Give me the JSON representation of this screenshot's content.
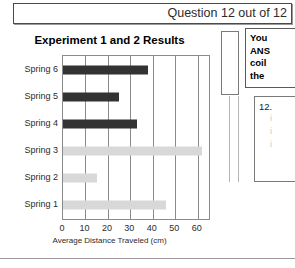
{
  "header": {
    "title": "Question 12 out of 12"
  },
  "chart_data": {
    "type": "bar",
    "orientation": "horizontal",
    "title": "Experiment 1 and 2 Results",
    "xlabel": "Average Distance Traveled (cm)",
    "ylabel": "",
    "xlim": [
      0,
      65
    ],
    "xticks": [
      0,
      10,
      20,
      30,
      40,
      50,
      60
    ],
    "grid": true,
    "legend": "none",
    "categories": [
      "Spring 1",
      "Spring 2",
      "Spring 3",
      "Spring 4",
      "Spring 5",
      "Spring 6"
    ],
    "display_order": [
      "Spring 6",
      "Spring 5",
      "Spring 4",
      "Spring 3",
      "Spring 2",
      "Spring 1"
    ],
    "values": [
      46,
      15,
      62,
      33,
      25,
      38
    ],
    "bars": [
      {
        "category": "Spring 6",
        "value": 38,
        "color": "#333333",
        "group": "Experiment 2"
      },
      {
        "category": "Spring 5",
        "value": 25,
        "color": "#333333",
        "group": "Experiment 2"
      },
      {
        "category": "Spring 4",
        "value": 33,
        "color": "#333333",
        "group": "Experiment 2"
      },
      {
        "category": "Spring 3",
        "value": 62,
        "color": "#d8d8d8",
        "group": "Experiment 1"
      },
      {
        "category": "Spring 2",
        "value": 15,
        "color": "#d8d8d8",
        "group": "Experiment 1"
      },
      {
        "category": "Spring 1",
        "value": 46,
        "color": "#d8d8d8",
        "group": "Experiment 1"
      }
    ],
    "colors": {
      "experiment_2": "#333333",
      "experiment_1": "#d8d8d8"
    }
  },
  "prompt": {
    "lines": [
      "You",
      "ANS",
      "coil",
      "the"
    ]
  },
  "question": {
    "number": "12.",
    "sub_lines": [
      "i",
      "i",
      "i"
    ]
  }
}
